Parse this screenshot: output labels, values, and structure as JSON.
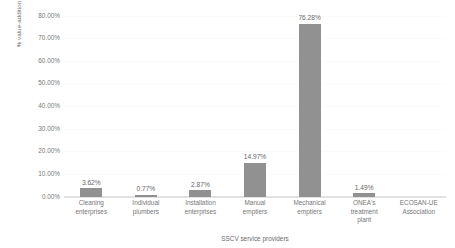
{
  "chart_data": {
    "type": "bar",
    "title": "",
    "subtitle": "",
    "xlabel": "SSCV service providers",
    "ylabel": "% value-addition",
    "categories": [
      "Cleaning enterprises",
      "Individual plumbers",
      "Installation enterprises",
      "Manual emptiers",
      "Mechanical emptiers",
      "ONEA's treatment plant",
      "ECOSAN-UE Association"
    ],
    "category_lines": [
      [
        "Cleaning",
        "enterprises"
      ],
      [
        "Individual",
        "plumbers"
      ],
      [
        "Installation",
        "enterprises"
      ],
      [
        "Manual",
        "emptiers"
      ],
      [
        "Mechanical",
        "emptiers"
      ],
      [
        "ONEA's",
        "treatment",
        "plant"
      ],
      [
        "ECOSAN-UE",
        "Association"
      ]
    ],
    "values": [
      3.62,
      0.77,
      2.87,
      14.97,
      76.28,
      1.49,
      0
    ],
    "value_labels": [
      "3.62%",
      "0.77%",
      "2.87%",
      "14.97%",
      "76.28%",
      "1.49%",
      ""
    ],
    "ylim": [
      0,
      80
    ],
    "ytick_values": [
      80,
      70,
      60,
      50,
      40,
      30,
      20,
      10,
      0
    ],
    "ytick_labels": [
      "80.00%",
      "70.00%",
      "60.00%",
      "50.00%",
      "40.00%",
      "30.00%",
      "20.00%",
      "10.00%",
      "0.00%"
    ],
    "grid": true,
    "legend": "none",
    "bar_color": "#919191",
    "gridline_color": "#fbfbfb",
    "axis_color": "#e2e2e2",
    "text_color": "#777777",
    "background": "#ffffff"
  }
}
